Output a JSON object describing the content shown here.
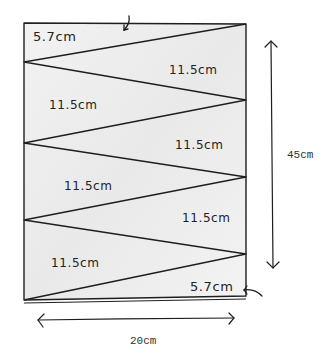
{
  "diagram": {
    "type": "cutting-layout",
    "colors": {
      "line": "#1e1e1e",
      "fill": "#efefef",
      "background": "#ffffff"
    },
    "rectangle": {
      "width_label": "20cm",
      "height_label": "45cm"
    },
    "segments": [
      {
        "id": "top",
        "label": "5.7cm"
      },
      {
        "id": "strip-1",
        "label": "11.5cm"
      },
      {
        "id": "strip-2",
        "label": "11.5cm"
      },
      {
        "id": "strip-3",
        "label": "11.5cm"
      },
      {
        "id": "strip-4",
        "label": "11.5cm"
      },
      {
        "id": "strip-5",
        "label": "11.5cm"
      },
      {
        "id": "strip-6",
        "label": "11.5cm"
      },
      {
        "id": "bottom",
        "label": "5.7cm"
      }
    ],
    "dimensions": {
      "width": "20cm",
      "height": "45cm"
    }
  }
}
